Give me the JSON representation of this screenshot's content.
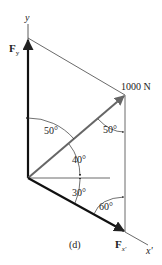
{
  "figure": {
    "caption": "(d)",
    "axes": {
      "y_label": "y",
      "x_label": "x'"
    },
    "forces": {
      "main": "1000 N",
      "fy": {
        "symbol": "F",
        "subscript": "y"
      },
      "fx": {
        "symbol": "F",
        "subscript": "x'"
      }
    },
    "angles": {
      "a1": "50°",
      "a2": "50°",
      "a3": "40°",
      "a4": "30°",
      "a5": "60°"
    },
    "colors": {
      "line": "#222222",
      "arrow": "#555555",
      "thin": "#444444"
    }
  }
}
